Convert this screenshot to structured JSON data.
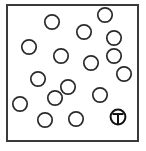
{
  "figure": {
    "title": "Scattered open circles in a rectangular frame with one T-marked circle",
    "type": "scatter",
    "background_color": "#ffffff",
    "frame": {
      "label": "frame-border",
      "x": 7,
      "y": 5,
      "width": 131,
      "height": 136,
      "stroke_color": "#3a3a3a",
      "stroke_width": 1.6,
      "fill_color": "#ffffff"
    },
    "circle_style": {
      "stroke_color": "#2a2a2a",
      "stroke_width": 1.7,
      "fill_color": "#ffffff",
      "radius": 7.2
    },
    "marked_circle_style": {
      "stroke_color": "#111111",
      "stroke_width": 2.0,
      "fill_color": "#ffffff",
      "radius": 7.4,
      "glyph": "T",
      "glyph_color": "#111111"
    },
    "counts": {
      "plain_circles": 16,
      "marked_circles": 1,
      "total_circles": 17
    },
    "legend": {
      "marked_label": "T",
      "marked_name": "target-circle"
    }
  },
  "chart_data": {
    "type": "scatter",
    "title": "Scattered open circles in a rectangular frame with one T-marked circle",
    "xlabel": "",
    "ylabel": "",
    "xlim": [
      7,
      138
    ],
    "ylim": [
      5,
      141
    ],
    "grid": false,
    "legend_position": "none",
    "series": [
      {
        "name": "plain-circles",
        "marker": "open-circle",
        "radius": 7.2,
        "points": [
          {
            "id": "c1",
            "x": 52,
            "y": 22
          },
          {
            "id": "c2",
            "x": 84,
            "y": 32
          },
          {
            "id": "c3",
            "x": 105,
            "y": 15
          },
          {
            "id": "c4",
            "x": 29,
            "y": 47
          },
          {
            "id": "c5",
            "x": 114,
            "y": 38
          },
          {
            "id": "c6",
            "x": 61,
            "y": 56
          },
          {
            "id": "c7",
            "x": 91,
            "y": 63
          },
          {
            "id": "c8",
            "x": 124,
            "y": 74
          },
          {
            "id": "c9",
            "x": 38,
            "y": 79
          },
          {
            "id": "c10",
            "x": 68,
            "y": 87
          },
          {
            "id": "c11",
            "x": 100,
            "y": 95
          },
          {
            "id": "c12",
            "x": 20,
            "y": 104
          },
          {
            "id": "c13",
            "x": 45,
            "y": 120
          },
          {
            "id": "c14",
            "x": 76,
            "y": 119
          },
          {
            "id": "c15",
            "x": 114,
            "y": 56
          },
          {
            "id": "c16",
            "x": 55,
            "y": 98
          }
        ]
      },
      {
        "name": "marked-circle",
        "marker": "circle-with-T",
        "radius": 7.4,
        "points": [
          {
            "id": "t1",
            "x": 118,
            "y": 117,
            "label": "T"
          }
        ]
      }
    ]
  }
}
